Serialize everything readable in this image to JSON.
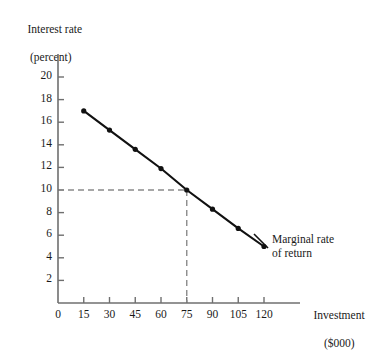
{
  "chart_data": {
    "type": "line",
    "title": "",
    "xlabel": "Investment ($000)",
    "ylabel": "Interest rate (percent)",
    "xlabel_line1": "Investment",
    "xlabel_line2": "($000)",
    "ylabel_line1": "Interest rate",
    "ylabel_line2": "(percent)",
    "series_name": "Marginal rate of return",
    "series_label_line1": "Marginal rate",
    "series_label_line2": "of return",
    "x": [
      15,
      30,
      45,
      60,
      75,
      90,
      105,
      120
    ],
    "values": [
      17,
      15.3,
      13.6,
      11.9,
      10,
      8.3,
      6.6,
      5
    ],
    "xticks": [
      "0",
      "15",
      "30",
      "45",
      "60",
      "75",
      "90",
      "105",
      "120"
    ],
    "xtick_values": [
      0,
      15,
      30,
      45,
      60,
      75,
      90,
      105,
      120
    ],
    "yticks": [
      "2",
      "4",
      "6",
      "8",
      "10",
      "12",
      "14",
      "16",
      "18",
      "20"
    ],
    "ytick_values": [
      2,
      4,
      6,
      8,
      10,
      12,
      14,
      16,
      18,
      20
    ],
    "xlim": [
      0,
      132
    ],
    "ylim": [
      0,
      21.5
    ],
    "grid": false,
    "legend": "none",
    "line_color": "#111111",
    "marker_color": "#111111",
    "axis_color": "#6f6f6f",
    "guide_color": "#8a8a8a",
    "annotations": [
      {
        "name": "equilibrium-guide",
        "type": "dashed-guide",
        "x": 75,
        "y": 10,
        "description": "Dashed lines from interest rate 10 percent to investment 75"
      }
    ]
  }
}
